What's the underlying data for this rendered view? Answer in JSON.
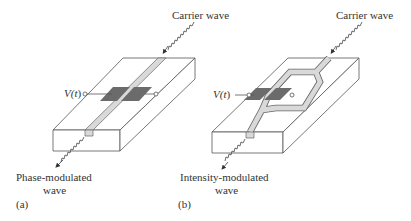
{
  "figure": {
    "panel_a": {
      "tag": "(a)",
      "title": "Phase-modulator",
      "input_label": "Carrier wave",
      "output_label_line1": "Phase-modulated",
      "output_label_line2": "wave",
      "voltage_label_prefix": "V(",
      "voltage_label_var": "t",
      "voltage_label_suffix": ")",
      "waveguide": "straight"
    },
    "panel_b": {
      "tag": "(b)",
      "title": "Intensity-modulator",
      "input_label": "Carrier wave",
      "output_label_line1": "Intensity-modulated",
      "output_label_line2": "wave",
      "voltage_label_prefix": "V(",
      "voltage_label_var": "t",
      "voltage_label_suffix": ")",
      "waveguide": "mach-zehnder"
    },
    "colors": {
      "line": "#555555",
      "electrode": "#6b6b6b",
      "waveguide": "#d9d9d9",
      "text": "#333333"
    }
  }
}
